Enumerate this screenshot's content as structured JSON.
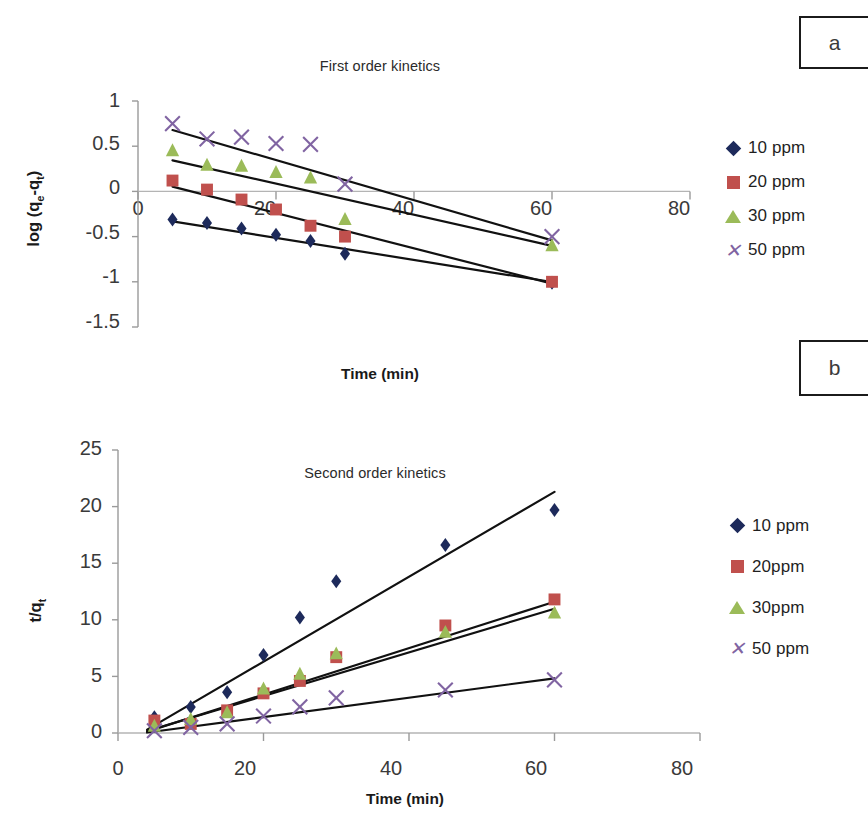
{
  "figure": {
    "panel_a_label": "a",
    "panel_b_label": "b"
  },
  "chart_a": {
    "title": "First order kinetics",
    "ylabel_html": "log (q<sub>e</sub>-q<sub>t</sub>)",
    "xlabel": "Time (min)",
    "yticks": [
      "1",
      "0.5",
      "0",
      "-0.5",
      "-1",
      "-1.5"
    ],
    "xticks": [
      "0",
      "20",
      "40",
      "60",
      "80"
    ],
    "legend": [
      {
        "label": "10 ppm",
        "marker": "diamond",
        "color": "#1d2a5b"
      },
      {
        "label": "20 ppm",
        "marker": "square",
        "color": "#c0504d"
      },
      {
        "label": "30 ppm",
        "marker": "triangle",
        "color": "#9bbb59"
      },
      {
        "label": "50 ppm",
        "marker": "cross",
        "color": "#8064a2"
      }
    ]
  },
  "chart_b": {
    "title": "Second order kinetics",
    "ylabel_html": "t/q<sub>t</sub>",
    "xlabel": "Time (min)",
    "yticks": [
      "25",
      "20",
      "15",
      "10",
      "5",
      "0"
    ],
    "xticks": [
      "0",
      "20",
      "40",
      "60",
      "80"
    ],
    "legend": [
      {
        "label": "10 ppm",
        "marker": "diamond",
        "color": "#1d2a5b"
      },
      {
        "label": "20ppm",
        "marker": "square",
        "color": "#c0504d"
      },
      {
        "label": "30ppm",
        "marker": "triangle",
        "color": "#9bbb59"
      },
      {
        "label": "50 ppm",
        "marker": "cross",
        "color": "#8064a2"
      }
    ]
  },
  "chart_data": [
    {
      "type": "scatter",
      "panel": "a",
      "title": "First order kinetics",
      "xlabel": "Time (min)",
      "ylabel": "log (qe-qt)",
      "xlim": [
        0,
        80
      ],
      "ylim": [
        -1.5,
        1
      ],
      "xticks": [
        0,
        20,
        40,
        60,
        80
      ],
      "yticks": [
        -1.5,
        -1,
        -0.5,
        0,
        0.5,
        1
      ],
      "grid": false,
      "legend_position": "right",
      "trendlines": true,
      "series": [
        {
          "name": "10 ppm",
          "marker": "diamond",
          "color": "#1d2a5b",
          "x": [
            5,
            10,
            15,
            20,
            25,
            30,
            60
          ],
          "y": [
            -0.31,
            -0.35,
            -0.41,
            -0.48,
            -0.55,
            -0.69,
            -1.01
          ],
          "fit": {
            "intercept": -0.27,
            "slope": -0.0122
          }
        },
        {
          "name": "20 ppm",
          "marker": "square",
          "color": "#c0504d",
          "x": [
            5,
            10,
            15,
            20,
            25,
            30,
            60
          ],
          "y": [
            0.12,
            0.02,
            -0.09,
            -0.2,
            -0.38,
            -0.5,
            -1.0
          ],
          "fit": {
            "intercept": 0.15,
            "slope": -0.0195
          }
        },
        {
          "name": "30 ppm",
          "marker": "triangle",
          "color": "#9bbb59",
          "x": [
            5,
            10,
            15,
            20,
            25,
            30,
            60
          ],
          "y": [
            0.45,
            0.29,
            0.28,
            0.21,
            0.15,
            -0.31,
            -0.6
          ],
          "fit": {
            "intercept": 0.43,
            "slope": -0.0172
          }
        },
        {
          "name": "50 ppm",
          "marker": "cross",
          "color": "#8064a2",
          "x": [
            5,
            10,
            15,
            20,
            25,
            30,
            60
          ],
          "y": [
            0.75,
            0.58,
            0.6,
            0.53,
            0.52,
            0.08,
            -0.5
          ],
          "fit": {
            "intercept": 0.79,
            "slope": -0.0222
          }
        }
      ]
    },
    {
      "type": "scatter",
      "panel": "b",
      "title": "Second order kinetics",
      "xlabel": "Time (min)",
      "ylabel": "t/qt",
      "xlim": [
        0,
        80
      ],
      "ylim": [
        0,
        25
      ],
      "xticks": [
        0,
        20,
        40,
        60,
        80
      ],
      "yticks": [
        0,
        5,
        10,
        15,
        20,
        25
      ],
      "grid": false,
      "legend_position": "right",
      "trendlines": true,
      "series": [
        {
          "name": "10 ppm",
          "marker": "diamond",
          "color": "#1d2a5b",
          "x": [
            5,
            10,
            15,
            20,
            25,
            30,
            45,
            60
          ],
          "y": [
            1.4,
            2.3,
            3.6,
            6.9,
            10.2,
            13.4,
            16.6,
            19.7
          ],
          "fit": {
            "intercept": -1.2,
            "slope": 0.375
          }
        },
        {
          "name": "20ppm",
          "marker": "square",
          "color": "#c0504d",
          "x": [
            5,
            10,
            15,
            20,
            25,
            30,
            45,
            60
          ],
          "y": [
            1.1,
            0.8,
            2.0,
            3.5,
            4.6,
            6.7,
            9.5,
            11.8
          ],
          "fit": {
            "intercept": -0.7,
            "slope": 0.205
          }
        },
        {
          "name": "30ppm",
          "marker": "triangle",
          "color": "#9bbb59",
          "x": [
            5,
            10,
            15,
            20,
            25,
            30,
            45,
            60
          ],
          "y": [
            0.6,
            1.2,
            1.8,
            3.9,
            5.2,
            7.0,
            8.9,
            10.6
          ],
          "fit": {
            "intercept": -0.6,
            "slope": 0.193
          }
        },
        {
          "name": "50 ppm",
          "marker": "cross",
          "color": "#8064a2",
          "x": [
            5,
            10,
            15,
            20,
            25,
            30,
            45,
            60
          ],
          "y": [
            0.2,
            0.5,
            0.8,
            1.5,
            2.3,
            3.1,
            3.8,
            4.7
          ],
          "fit": {
            "intercept": -0.3,
            "slope": 0.0855
          }
        }
      ]
    }
  ]
}
